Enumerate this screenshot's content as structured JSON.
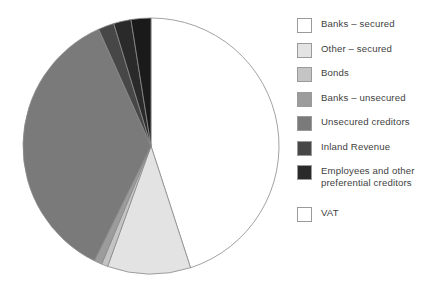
{
  "chart_data": {
    "type": "pie",
    "title": "",
    "subtitle": "",
    "xlabel": "",
    "ylabel": "",
    "legend_position": "right",
    "grid": false,
    "start_angle_deg": 0,
    "direction": "clockwise",
    "categories": [
      "Banks – secured",
      "Other – secured",
      "Bonds",
      "Banks – unsecured",
      "Unsecured creditors",
      "Inland Revenue",
      "Employees and other preferential creditors",
      "VAT"
    ],
    "values": [
      45.0,
      10.5,
      0.8,
      1.0,
      36.0,
      2.0,
      2.2,
      2.5
    ],
    "colors": [
      "#ffffff",
      "#e3e3e3",
      "#c4c4c4",
      "#9c9c9c",
      "#7a7a7a",
      "#474747",
      "#2a2a2a",
      "#1a1a1a"
    ],
    "slice_edge_color": "#8a8a8a",
    "labels_shown": false
  },
  "legend": {
    "items": [
      {
        "label": "Banks – secured",
        "swatch": "#ffffff",
        "icon": "legend-swatch-icon"
      },
      {
        "label": "Other – secured",
        "swatch": "#e3e3e3",
        "icon": "legend-swatch-icon"
      },
      {
        "label": "Bonds",
        "swatch": "#c4c4c4",
        "icon": "legend-swatch-icon"
      },
      {
        "label": "Banks – unsecured",
        "swatch": "#9c9c9c",
        "icon": "legend-swatch-icon"
      },
      {
        "label": "Unsecured creditors",
        "swatch": "#7a7a7a",
        "icon": "legend-swatch-icon"
      },
      {
        "label": "Inland Revenue",
        "swatch": "#474747",
        "icon": "legend-swatch-icon"
      },
      {
        "label": "Employees and other\npreferential creditors",
        "swatch": "#2a2a2a",
        "icon": "legend-swatch-icon"
      },
      {
        "label": "VAT",
        "swatch": "#ffffff",
        "icon": "legend-swatch-icon"
      }
    ]
  },
  "theme": {
    "background": "#ffffff",
    "text_color": "#3f3f3f",
    "outline_color": "#8a8a8a"
  }
}
